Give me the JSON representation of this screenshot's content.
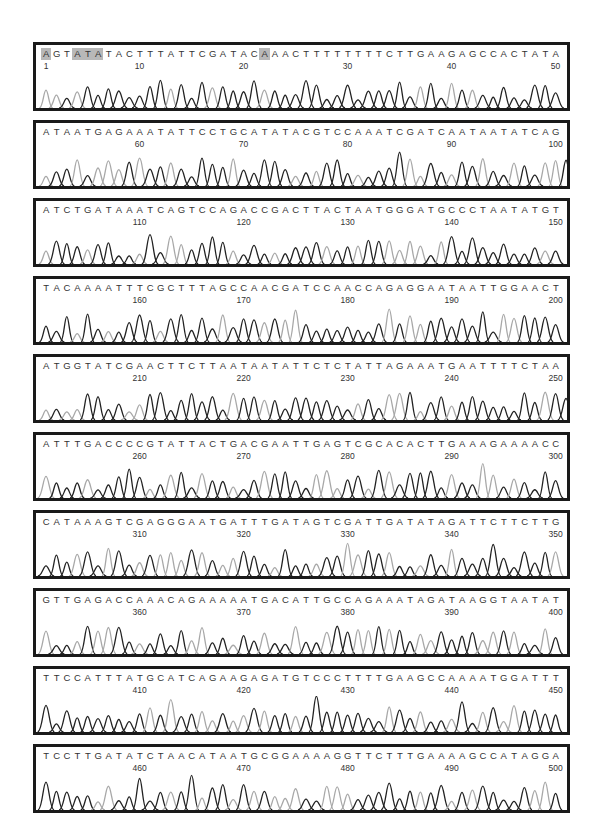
{
  "figure": {
    "type": "dna-sequencing-chromatogram",
    "bases_per_panel": 50,
    "highlighted_positions": [
      1,
      4,
      5,
      6,
      22
    ],
    "colors": {
      "border": "#1a1a1a",
      "trace_dark": "#222222",
      "trace_light": "#a8a8a8",
      "highlight": "#b8b8b8",
      "text": "#333333"
    },
    "panels": [
      {
        "start": 1,
        "sequence": "AGTATATACTTTATTCGATACAAACTTTTTTTTCTTGAAGAGCCACTATA",
        "ticks": [
          "1",
          "10",
          "20",
          "30",
          "40",
          "50"
        ]
      },
      {
        "start": 51,
        "sequence": "ATAATGAGAAATATTCCTGCATATACGTCCAAATCGATCAATAATATCAGA",
        "ticks": [
          "60",
          "70",
          "80",
          "90",
          "100"
        ]
      },
      {
        "start": 101,
        "sequence": "ATCTGATAAATCAGTCCAGACCGACTTACTAATGGGATGCCCTAATATGT",
        "ticks": [
          "110",
          "120",
          "130",
          "140",
          "150"
        ]
      },
      {
        "start": 151,
        "sequence": "TACAAAATTTCGCTTTAGCCAACGATCCAACCAGAGGAATAATTGGAACT",
        "ticks": [
          "160",
          "170",
          "180",
          "190",
          "200"
        ]
      },
      {
        "start": 201,
        "sequence": "ATGGTATCGAACTTCTTAATAATATTCTCTATTAGAAATGAATTTTCTAAC",
        "ticks": [
          "210",
          "220",
          "230",
          "240",
          "250"
        ]
      },
      {
        "start": 251,
        "sequence": "ATTTGACCCCGTATTACTGACGAATTGAGTCGCACACTTGAAAGAAAACC",
        "ticks": [
          "260",
          "270",
          "280",
          "290",
          "300"
        ]
      },
      {
        "start": 301,
        "sequence": "CATAAAGTCGAGGGAATGATTTGATAGTCGATTGATATAGATTCTTCTTG",
        "ticks": [
          "310",
          "320",
          "330",
          "340",
          "350"
        ]
      },
      {
        "start": 351,
        "sequence": "GTTGAGACCAAACAGAAAAATGACATTGCCAGAAATAGATAAGGTAATAT",
        "ticks": [
          "360",
          "370",
          "380",
          "390",
          "400"
        ]
      },
      {
        "start": 401,
        "sequence": "TTCCATTTATGCATCAGAAGAGATGTCCCTTTTGAAGCCAAAATGGATTT",
        "ticks": [
          "410",
          "420",
          "430",
          "440",
          "450"
        ]
      },
      {
        "start": 451,
        "sequence": "TCCTTGATATCTAACATAATGCGGAAAAGGTTCTTTGAAAAGCCATAGGA",
        "ticks": [
          "460",
          "470",
          "480",
          "490",
          "500"
        ]
      }
    ]
  }
}
